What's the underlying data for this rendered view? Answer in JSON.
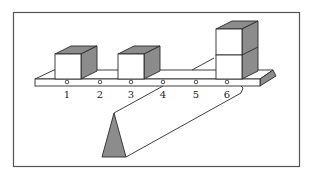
{
  "diagram": {
    "title": "",
    "colors": {
      "stroke": "#2a2a2a",
      "shade": "#8c8c8c",
      "face": "#ffffff",
      "frame": "#555555"
    },
    "beam": {
      "positions": [
        {
          "label": "1",
          "x": 67
        },
        {
          "label": "2",
          "x": 100
        },
        {
          "label": "3",
          "x": 131
        },
        {
          "label": "4",
          "x": 163
        },
        {
          "label": "5",
          "x": 196
        },
        {
          "label": "6",
          "x": 227
        }
      ],
      "fulcrum_position": "4"
    },
    "weights": [
      {
        "position": "1",
        "count": 1
      },
      {
        "position": "3",
        "count": 1
      },
      {
        "position": "6",
        "count": 2
      }
    ]
  }
}
